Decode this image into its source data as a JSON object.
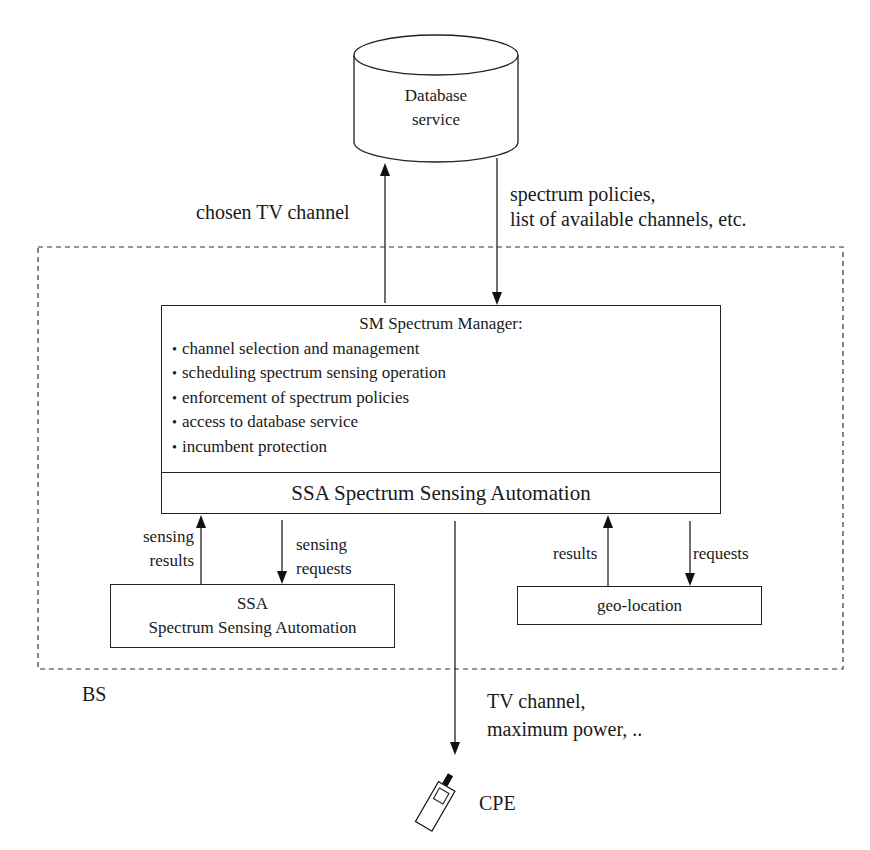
{
  "diagram": {
    "database": {
      "label_line1": "Database",
      "label_line2": "service"
    },
    "edges": {
      "to_database": "chosen TV channel",
      "from_database_line1": "spectrum policies,",
      "from_database_line2": "list of available channels, etc.",
      "sensing_results_line1": "sensing",
      "sensing_results_line2": "results",
      "sensing_requests_line1": "sensing",
      "sensing_requests_line2": "requests",
      "geo_results": "results",
      "geo_requests": "requests",
      "to_cpe_line1": "TV channel,",
      "to_cpe_line2": "maximum power, .."
    },
    "spectrum_manager": {
      "title": "SM Spectrum Manager:",
      "functions": [
        "channel selection and management",
        "scheduling spectrum sensing operation",
        "enforcement of spectrum policies",
        "access to database service",
        "incumbent protection"
      ],
      "ssa_bar": "SSA Spectrum Sensing Automation"
    },
    "ssa_module": {
      "line1": "SSA",
      "line2": "Spectrum Sensing Automation"
    },
    "geo_module": {
      "label": "geo-location"
    },
    "base_station": {
      "label": "BS"
    },
    "cpe": {
      "label": "CPE",
      "icon": "mobile-device-icon"
    },
    "colors": {
      "stroke": "#222222",
      "background": "#ffffff",
      "text": "#1a1a1a"
    }
  }
}
